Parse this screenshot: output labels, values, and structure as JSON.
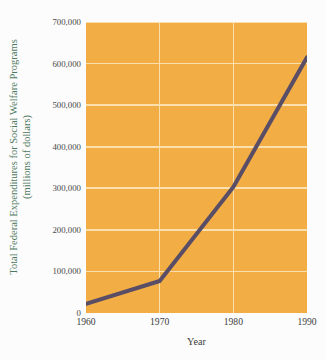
{
  "chart_data": {
    "type": "line",
    "title": "",
    "xlabel": "Year",
    "ylabel": "Total Federal Expenditures for Social Welfare Programs (millions of dollars)",
    "ylabel_line1": "Total Federal Expenditures for Social Welfare Programs",
    "ylabel_line2": "(millions of dollars)",
    "x": [
      1960,
      1970,
      1980,
      1990
    ],
    "values": [
      22000,
      77000,
      303000,
      615000
    ],
    "xtick_labels": [
      "1960",
      "1970",
      "1980",
      "1990"
    ],
    "ytick_labels": [
      "0",
      "100,000",
      "200,000",
      "300,000",
      "400,000",
      "500,000",
      "600,000",
      "700,000"
    ],
    "ytick_values": [
      0,
      100000,
      200000,
      300000,
      400000,
      500000,
      600000,
      700000
    ],
    "xlim": [
      1960,
      1990
    ],
    "ylim": [
      0,
      700000
    ],
    "grid": true,
    "legend": "none",
    "colors": {
      "plot_background": "#f2ae45",
      "gridline": "#fbe0ae",
      "data_line": "#5a4d66",
      "ylabel_text": "#4f7a62",
      "tick_text": "#4a4a4a",
      "figure_background": "#fcfcfc"
    }
  }
}
